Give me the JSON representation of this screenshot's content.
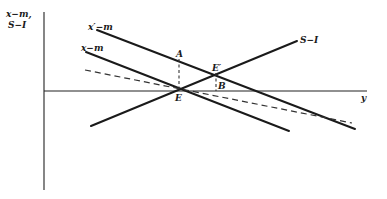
{
  "diagram": {
    "y_axis_label_line1": "x−m,",
    "y_axis_label_line2": "S−I",
    "x_axis_label": "y",
    "curves": [
      {
        "id": "x-prime-minus-m",
        "label": "x′−m",
        "style": "solid"
      },
      {
        "id": "x-minus-m",
        "label": "x−m",
        "style": "solid"
      },
      {
        "id": "s-minus-i",
        "label": "S−I",
        "style": "solid"
      },
      {
        "id": "dashed-line",
        "label": "",
        "style": "dashed"
      }
    ],
    "points": {
      "A": "A",
      "E": "E",
      "E_prime": "E′",
      "B": "B"
    }
  }
}
